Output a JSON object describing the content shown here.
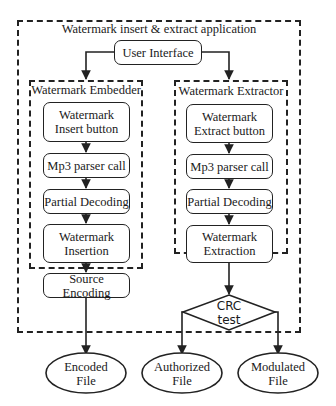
{
  "diagram": {
    "title": "Watermark insert & extract application",
    "user_interface": "User Interface",
    "embedder": {
      "title": "Watermark Embedder",
      "steps": [
        "Watermark\nInsert button",
        "Mp3 parser call",
        "Partial Decoding",
        "Watermark\nInsertion",
        "Source Encoding"
      ]
    },
    "extractor": {
      "title": "Watermark Extractor",
      "steps": [
        "Watermark\nExtract button",
        "Mp3 parser call",
        "Partial Decoding",
        "Watermark\nExtraction"
      ]
    },
    "decision": "CRC\ntest",
    "outputs": {
      "encoded": "Encoded\nFile",
      "authorized": "Authorized\nFile",
      "modulated": "Modulated\nFile"
    }
  }
}
